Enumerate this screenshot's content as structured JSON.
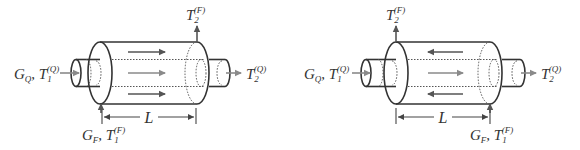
{
  "figure": {
    "colors": {
      "line": "#333333",
      "shell_arrow": "#555555",
      "tube_arrow": "#8a8a8a",
      "background": "#ffffff"
    },
    "diagrams": [
      {
        "name": "co-current-flow",
        "flow_mode": "parallel",
        "labels": {
          "tube_inlet": {
            "main": "G",
            "sub": "Q",
            "sep": ", ",
            "var": "T",
            "var_sub": "1",
            "var_sup": "(Q)"
          },
          "tube_outlet": {
            "var": "T",
            "var_sub": "2",
            "var_sup": "(Q)"
          },
          "shell_outlet": {
            "var": "T",
            "var_sub": "2",
            "var_sup": "(F)"
          },
          "shell_inlet": {
            "main": "G",
            "sub": "F",
            "sep": ", ",
            "var": "T",
            "var_sub": "1",
            "var_sup": "(F)"
          },
          "length": "L"
        },
        "arrows": {
          "shell_top": "right",
          "tube_middle": "right",
          "shell_bottom": "right"
        }
      },
      {
        "name": "counter-current-flow",
        "flow_mode": "counter",
        "labels": {
          "tube_inlet": {
            "main": "G",
            "sub": "Q",
            "sep": ", ",
            "var": "T",
            "var_sub": "1",
            "var_sup": "(Q)"
          },
          "tube_outlet": {
            "var": "T",
            "var_sub": "2",
            "var_sup": "(Q)"
          },
          "shell_outlet": {
            "var": "T",
            "var_sub": "2",
            "var_sup": "(F)"
          },
          "shell_inlet": {
            "main": "G",
            "sub": "F",
            "sep": ", ",
            "var": "T",
            "var_sub": "1",
            "var_sup": "(F)"
          },
          "length": "L"
        },
        "arrows": {
          "shell_top": "left",
          "tube_middle": "right",
          "shell_bottom": "left"
        }
      }
    ]
  }
}
